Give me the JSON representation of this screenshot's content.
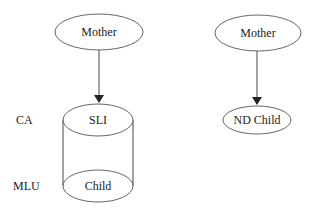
{
  "diagram": {
    "left": {
      "parent": {
        "label": "Mother"
      },
      "child_top": {
        "label": "SLI"
      },
      "child_bottom": {
        "label": "Child"
      },
      "side_labels": {
        "top": "CA",
        "bottom": "MLU"
      }
    },
    "right": {
      "parent": {
        "label": "Mother"
      },
      "child": {
        "label": "ND Child"
      }
    }
  }
}
